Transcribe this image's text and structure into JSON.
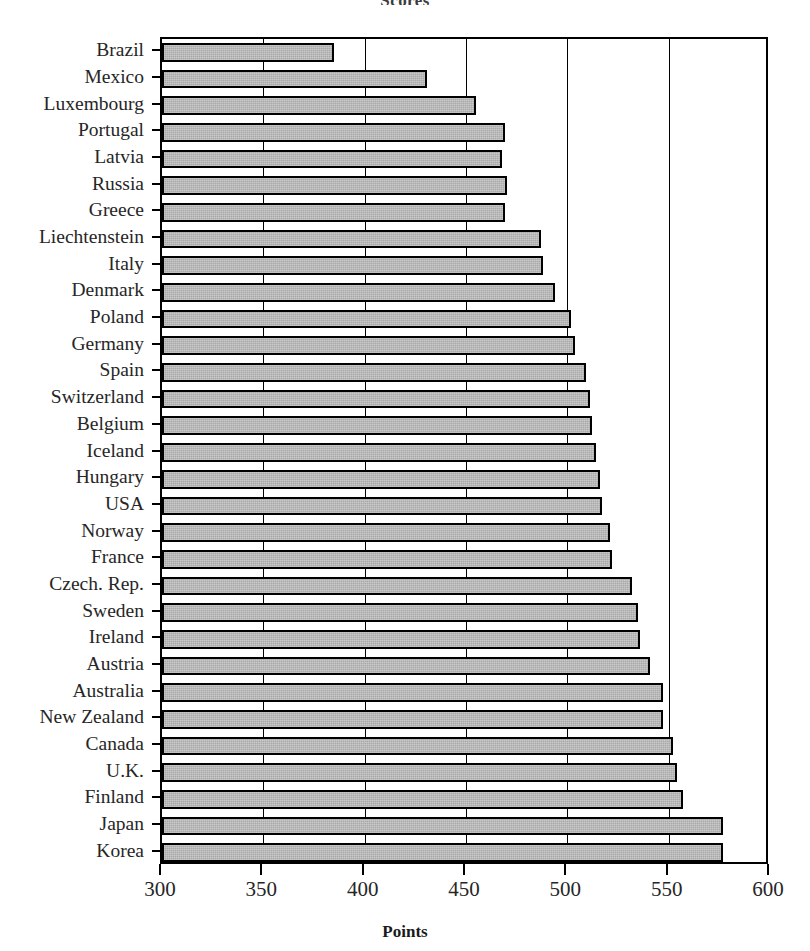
{
  "chart_data": {
    "type": "bar",
    "orientation": "horizontal",
    "title": "Scores",
    "xlabel": "Points",
    "ylabel": "",
    "xlim": [
      300,
      600
    ],
    "xticks": [
      300,
      350,
      400,
      450,
      500,
      550,
      600
    ],
    "xtick_labels": [
      "300",
      "350",
      "400",
      "450",
      "500",
      "550",
      "600"
    ],
    "grid": true,
    "grid_axis": "x",
    "legend": false,
    "bar_fill_color": "#a9a9a9",
    "bar_edge_color": "#000000",
    "categories": [
      "Brazil",
      "Mexico",
      "Luxembourg",
      "Portugal",
      "Latvia",
      "Russia",
      "Greece",
      "Liechtenstein",
      "Italy",
      "Denmark",
      "Poland",
      "Germany",
      "Spain",
      "Switzerland",
      "Belgium",
      "Iceland",
      "Hungary",
      "USA",
      "Norway",
      "France",
      "Czech. Rep.",
      "Sweden",
      "Ireland",
      "Austria",
      "Australia",
      "New Zealand",
      "Canada",
      "U.K.",
      "Finland",
      "Japan",
      "Korea"
    ],
    "values": [
      385,
      431,
      455,
      469,
      468,
      470,
      469,
      487,
      488,
      494,
      502,
      504,
      509,
      511,
      512,
      514,
      516,
      517,
      521,
      522,
      532,
      535,
      536,
      541,
      547,
      547,
      552,
      554,
      557,
      577,
      577
    ]
  }
}
